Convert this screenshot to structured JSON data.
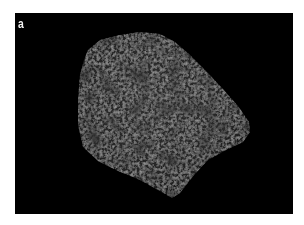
{
  "figure": {
    "panel_label": "a",
    "colors": {
      "background": "#000000",
      "rock_base": "#2a2a2a",
      "rock_highlight": "#555555",
      "rock_shadow": "#111111",
      "label": "#f2f2f2",
      "page": "#ffffff"
    }
  }
}
